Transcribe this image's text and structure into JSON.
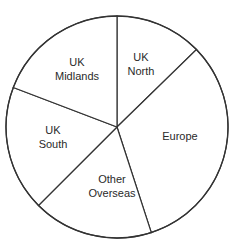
{
  "chart_data": {
    "type": "pie",
    "title": "",
    "start_angle_deg": 0,
    "direction": "clockwise",
    "unit": "percent (estimated from slice angles)",
    "slices": [
      {
        "label": "UK North",
        "lines": [
          "UK",
          "North"
        ],
        "value": 12.7,
        "label_pos": [
          141,
          57
        ]
      },
      {
        "label": "Europe",
        "lines": [
          "Europe"
        ],
        "value": 32.3,
        "label_pos": [
          180,
          136
        ]
      },
      {
        "label": "Other Overseas",
        "lines": [
          "Other",
          "Overseas"
        ],
        "value": 17.5,
        "label_pos": [
          112,
          179
        ]
      },
      {
        "label": "UK South",
        "lines": [
          "UK",
          "South"
        ],
        "value": 18.3,
        "label_pos": [
          53,
          130
        ]
      },
      {
        "label": "UK Midlands",
        "lines": [
          "UK",
          "Midlands"
        ],
        "value": 19.2,
        "label_pos": [
          77,
          62
        ]
      }
    ],
    "legend": "none (labels inside slices)",
    "colors": {
      "stroke": "#333333",
      "fill": "#ffffff",
      "text": "#2a2a2a"
    }
  },
  "geometry": {
    "cx": 117,
    "cy": 127,
    "r": 111
  }
}
